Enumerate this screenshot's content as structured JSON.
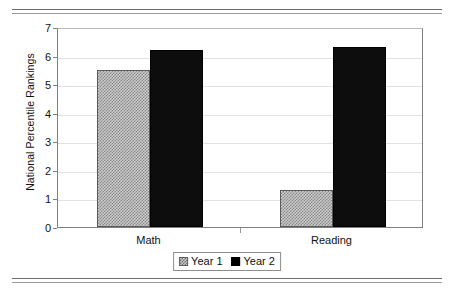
{
  "figure": {
    "top_rule": "",
    "bottom_rule": ""
  },
  "chart_data": {
    "type": "bar",
    "title": "",
    "xlabel": "",
    "ylabel": "National Percentile Rankings",
    "categories": [
      "Math",
      "Reading"
    ],
    "series": [
      {
        "name": "Year 1",
        "values": [
          5.5,
          1.3
        ],
        "color": "#c9c9c9",
        "pattern": "checker-hatch"
      },
      {
        "name": "Year 2",
        "values": [
          6.2,
          6.3
        ],
        "color": "#0d0d0d",
        "pattern": "solid"
      }
    ],
    "ylim": [
      0,
      7
    ],
    "yticks": [
      0,
      1,
      2,
      3,
      4,
      5,
      6,
      7
    ],
    "ytick_labels": [
      "0",
      "1",
      "2",
      "3",
      "4",
      "5",
      "6",
      "7"
    ],
    "grid": true,
    "legend_position": "bottom-center"
  },
  "legend": {
    "entries": [
      {
        "label": "Year 1"
      },
      {
        "label": "Year 2"
      }
    ]
  }
}
